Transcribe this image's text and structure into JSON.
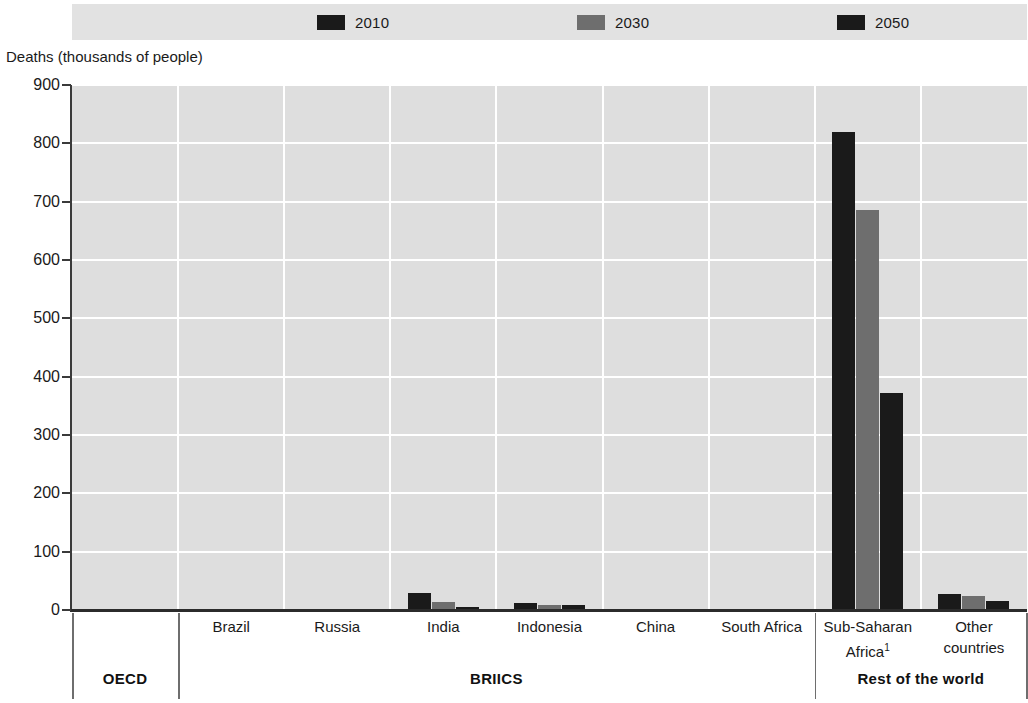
{
  "axis_title": "Deaths (thousands of people)",
  "legend": {
    "entries": [
      {
        "label": "2010",
        "color": "#1a1a1a",
        "x": 245
      },
      {
        "label": "2030",
        "color": "#6e6e6e",
        "x": 505
      },
      {
        "label": "2050",
        "color": "#1a1a1a",
        "x": 765
      }
    ]
  },
  "groups": [
    {
      "label": "OECD"
    },
    {
      "label": "BRIICS"
    },
    {
      "label": "Rest of the world"
    }
  ],
  "footnote_marker": "1",
  "chart_data": {
    "type": "bar",
    "title": "",
    "subtitle": "",
    "xlabel": "",
    "ylabel": "Deaths (thousands of people)",
    "ylim": [
      0,
      900
    ],
    "yticks": [
      0,
      100,
      200,
      300,
      400,
      500,
      600,
      700,
      800,
      900
    ],
    "grid": true,
    "legend_position": "top",
    "categories": [
      "OECD",
      "Brazil",
      "Russia",
      "India",
      "Indonesia",
      "China",
      "South Africa",
      "Sub-Saharan Africa",
      "Other countries"
    ],
    "category_groups": [
      "OECD",
      "BRIICS",
      "BRIICS",
      "BRIICS",
      "BRIICS",
      "BRIICS",
      "BRIICS",
      "Rest of the world",
      "Rest of the world"
    ],
    "series": [
      {
        "name": "2010",
        "color": "#1a1a1a",
        "values": [
          0,
          0,
          0,
          30,
          12,
          0,
          0,
          820,
          27
        ]
      },
      {
        "name": "2030",
        "color": "#6e6e6e",
        "values": [
          0,
          0,
          0,
          13,
          8,
          0,
          0,
          685,
          24
        ]
      },
      {
        "name": "2050",
        "color": "#1a1a1a",
        "values": [
          0,
          0,
          0,
          5,
          8,
          0,
          0,
          372,
          16
        ]
      }
    ]
  }
}
